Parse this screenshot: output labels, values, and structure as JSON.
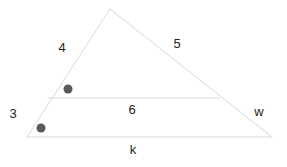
{
  "figure": {
    "kind": "geometry-diagram",
    "background_color": "#ffffff",
    "line_color": "#d9d9d9",
    "line_width": 1,
    "text_color": "#231f20",
    "point_color": "#5a5a5a",
    "point_radius": 4.5
  },
  "shape": {
    "vertices": {
      "apex": {
        "name": "apex",
        "x": 110,
        "y": 9
      },
      "bottom_left": {
        "name": "bottom-left",
        "x": 27,
        "y": 137
      },
      "bottom_right": {
        "name": "bottom-right",
        "x": 272,
        "y": 137
      },
      "midline_left": {
        "name": "midline-left",
        "x": 48,
        "y": 98
      },
      "midline_right": {
        "name": "midline-right",
        "x": 220,
        "y": 98
      }
    },
    "edges": [
      {
        "name": "left-side",
        "from": "apex",
        "to": "bottom_left"
      },
      {
        "name": "right-side",
        "from": "apex",
        "to": "bottom_right"
      },
      {
        "name": "base",
        "from": "bottom_left",
        "to": "bottom_right"
      },
      {
        "name": "midline",
        "from": "midline_left",
        "to": "midline_right"
      }
    ]
  },
  "labels": [
    {
      "id": "label-4",
      "text": "4",
      "x": 62,
      "y": 47,
      "edge": "left-side-upper"
    },
    {
      "id": "label-5",
      "text": "5",
      "x": 177,
      "y": 43,
      "edge": "right-side-upper"
    },
    {
      "id": "label-3",
      "text": "3",
      "x": 13,
      "y": 113,
      "edge": "left-side-lower"
    },
    {
      "id": "label-6",
      "text": "6",
      "x": 132,
      "y": 109,
      "edge": "midline"
    },
    {
      "id": "label-w",
      "text": "w",
      "x": 259,
      "y": 111,
      "edge": "right-side-lower"
    },
    {
      "id": "label-k",
      "text": "k",
      "x": 133,
      "y": 149,
      "edge": "base"
    }
  ],
  "points": [
    {
      "id": "point-upper",
      "x": 68,
      "y": 89
    },
    {
      "id": "point-lower",
      "x": 41,
      "y": 128
    }
  ]
}
